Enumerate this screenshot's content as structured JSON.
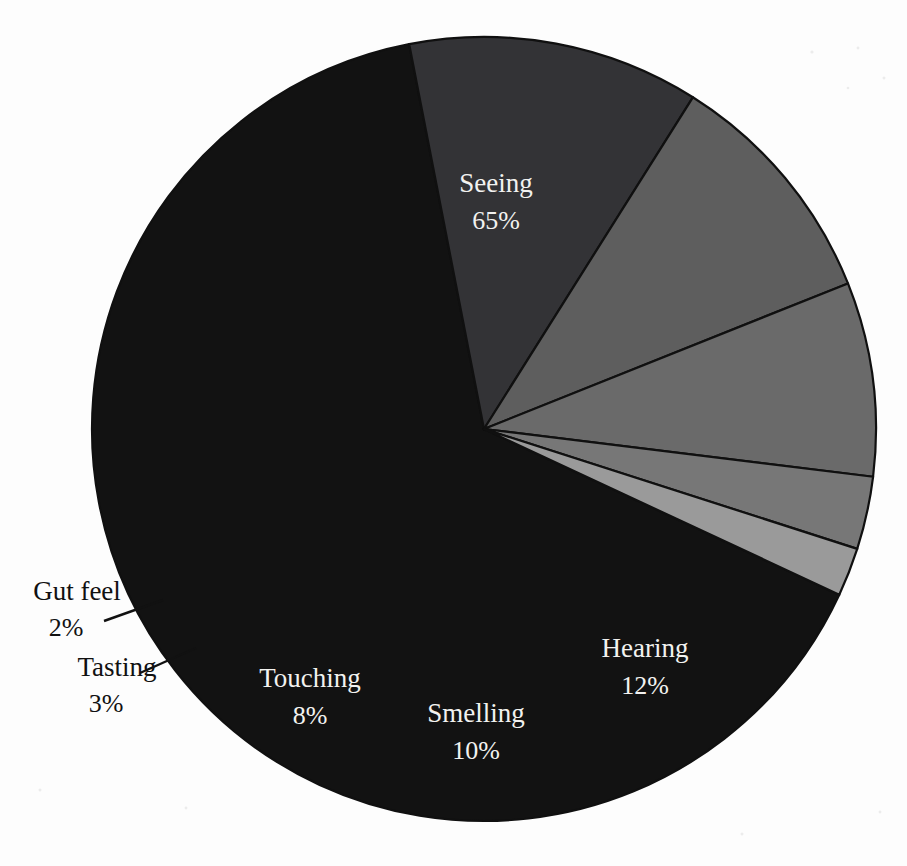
{
  "chart_data": {
    "type": "pie",
    "title": "",
    "subtitle": "",
    "xlabel": "",
    "ylabel": "",
    "legend_position": "none",
    "grid": false,
    "value_unit": "percent",
    "total": 100,
    "categories": [
      "Seeing",
      "Hearing",
      "Smelling",
      "Touching",
      "Tasting",
      "Gut feel"
    ],
    "values": [
      65,
      12,
      10,
      8,
      3,
      2
    ],
    "slices": [
      {
        "label": "Seeing",
        "value": 65,
        "value_text": "65%",
        "color": "#121212",
        "label_placement": "inside",
        "label_color": "#f2f2f0"
      },
      {
        "label": "Hearing",
        "value": 12,
        "value_text": "12%",
        "color": "#333336",
        "label_placement": "inside",
        "label_color": "#f2f2f0"
      },
      {
        "label": "Smelling",
        "value": 10,
        "value_text": "10%",
        "color": "#5e5e5e",
        "label_placement": "inside",
        "label_color": "#f7f7f5"
      },
      {
        "label": "Touching",
        "value": 8,
        "value_text": "8%",
        "color": "#6a6a6a",
        "label_placement": "inside",
        "label_color": "#f7f7f5"
      },
      {
        "label": "Tasting",
        "value": 3,
        "value_text": "3%",
        "color": "#777777",
        "label_placement": "outside",
        "label_color": "#111111"
      },
      {
        "label": "Gut feel",
        "value": 2,
        "value_text": "2%",
        "color": "#9a9a9a",
        "label_placement": "outside",
        "label_color": "#111111"
      }
    ],
    "geometry": {
      "center_x": 484,
      "center_y": 429,
      "radius": 392,
      "start_angle_deg": 25,
      "direction": "clockwise"
    },
    "background_color": "#fdfdfd",
    "slice_border_color": "#101010"
  },
  "labels": {
    "seeing_name": "Seeing",
    "seeing_pct": "65%",
    "hearing_name": "Hearing",
    "hearing_pct": "12%",
    "smelling_name": "Smelling",
    "smelling_pct": "10%",
    "touching_name": "Touching",
    "touching_pct": "8%",
    "tasting_name": "Tasting",
    "tasting_pct": "3%",
    "gutfeel_name": "Gut feel",
    "gutfeel_pct": "2%"
  }
}
